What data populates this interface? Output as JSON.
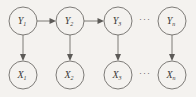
{
  "figure": {
    "type": "probabilistic-graphical-model",
    "name": "hidden-markov-model-chain",
    "background_color": "#f4f2ef",
    "node_stroke_color": "#6f6d6a",
    "edge_color": "#6f6d6a",
    "label_color": "#3b3936"
  },
  "hidden_nodes": [
    {
      "id": "Y1",
      "base": "Y",
      "subscript": "1",
      "label": "Y₁",
      "cx": 23,
      "cy": 21,
      "r": 14
    },
    {
      "id": "Y2",
      "base": "Y",
      "subscript": "2",
      "label": "Y₂",
      "cx": 70,
      "cy": 21,
      "r": 14
    },
    {
      "id": "Y3",
      "base": "Y",
      "subscript": "3",
      "label": "Y₃",
      "cx": 118,
      "cy": 21,
      "r": 14
    },
    {
      "id": "Yn",
      "base": "Y",
      "subscript": "n",
      "label": "Yₙ",
      "cx": 172,
      "cy": 21,
      "r": 14
    }
  ],
  "observed_nodes": [
    {
      "id": "X1",
      "base": "X",
      "subscript": "1",
      "label": "X₁",
      "cx": 23,
      "cy": 75,
      "r": 14
    },
    {
      "id": "X2",
      "base": "X",
      "subscript": "2",
      "label": "X₂",
      "cx": 70,
      "cy": 75,
      "r": 14
    },
    {
      "id": "X3",
      "base": "X",
      "subscript": "3",
      "label": "X₃",
      "cx": 118,
      "cy": 75,
      "r": 14
    },
    {
      "id": "Xn",
      "base": "X",
      "subscript": "n",
      "label": "Xₙ",
      "cx": 172,
      "cy": 75,
      "r": 14
    }
  ],
  "horizontal_edges": [
    {
      "from": "Y1",
      "to": "Y2",
      "directed": true
    },
    {
      "from": "Y2",
      "to": "Y3",
      "directed": true
    }
  ],
  "vertical_edges": [
    {
      "from": "Y1",
      "to": "X1",
      "directed": true
    },
    {
      "from": "Y2",
      "to": "X2",
      "directed": true
    },
    {
      "from": "Y3",
      "to": "X3",
      "directed": true
    },
    {
      "from": "Yn",
      "to": "Xn",
      "directed": true
    }
  ],
  "ellipses": [
    {
      "id": "ellipsis-top",
      "text": "···",
      "cx": 145,
      "cy": 21
    },
    {
      "id": "ellipsis-bottom",
      "text": "···",
      "cx": 145,
      "cy": 75
    }
  ]
}
